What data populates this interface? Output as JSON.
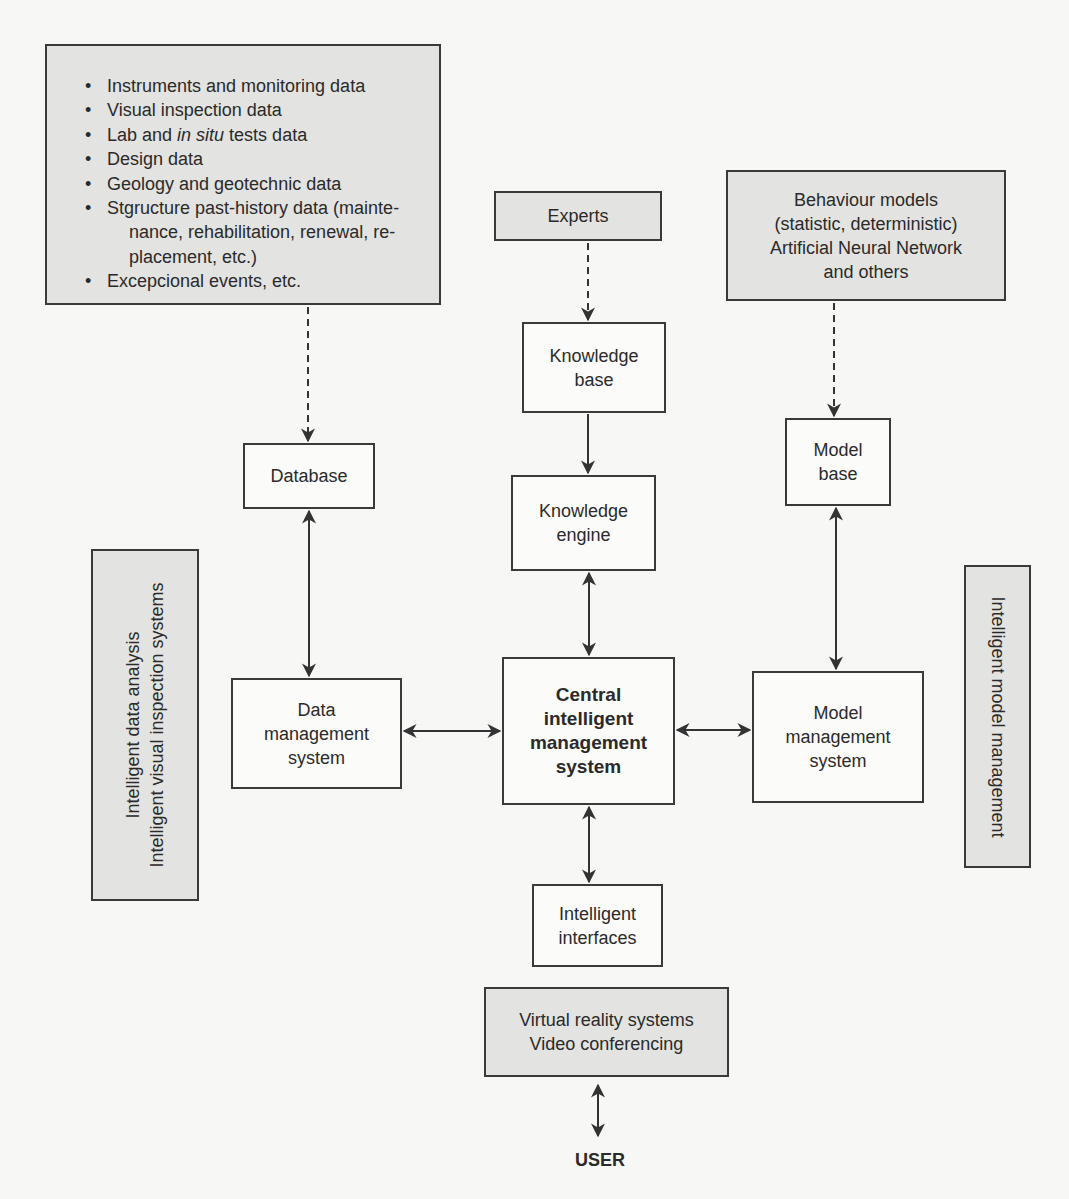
{
  "diagram": {
    "data_sources": {
      "items": [
        {
          "text": "Instruments and monitoring data"
        },
        {
          "text": "Visual inspection data"
        },
        {
          "pre": "Lab and ",
          "italic": "in situ",
          "post": " tests data"
        },
        {
          "text": "Design data"
        },
        {
          "text": "Geology and geotechnic data"
        },
        {
          "text": "Stgructure past-history data (mainte-",
          "cont1": "nance, rehabilitation, renewal, re-",
          "cont2": "placement, etc.)"
        },
        {
          "text": "Excepcional events, etc."
        }
      ]
    },
    "experts": "Experts",
    "behaviour_models": "Behaviour models\n(statistic, deterministic)\nArtificial Neural Network\nand others",
    "knowledge_base": "Knowledge\nbase",
    "database": "Database",
    "knowledge_engine": "Knowledge\nengine",
    "model_base": "Model\nbase",
    "data_management_system": "Data\nmanagement\nsystem",
    "central_system": "Central\nintelligent\nmanagement\nsystem",
    "model_management_system": "Model\nmanagement\nsystem",
    "intelligent_interfaces": "Intelligent\ninterfaces",
    "vr_box": "Virtual reality systems\nVideo conferencing",
    "user": "USER",
    "left_side_label": "Intelligent data analysis\nIntelligent visual inspection systems",
    "right_side_label": "Intelligent model management"
  },
  "colors": {
    "gray_fill": "#e3e3e1",
    "white_fill": "#fbfbfa",
    "stroke": "#3a3a3a"
  }
}
